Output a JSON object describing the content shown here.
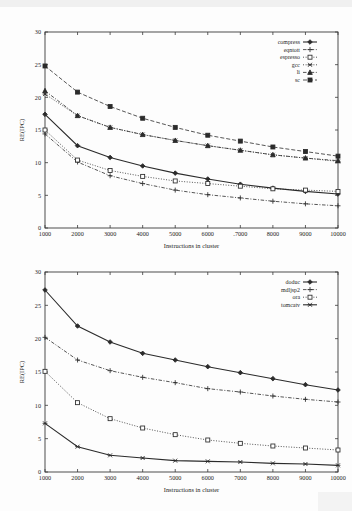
{
  "figures": [
    {
      "id": "top",
      "chart_data": {
        "type": "line",
        "title": "",
        "xlabel": "Instructions in cluster",
        "ylabel": "RE(IPC)",
        "xlim": [
          1000,
          10000
        ],
        "ylim": [
          0,
          30
        ],
        "xticks": [
          1000,
          2000,
          3000,
          4000,
          5000,
          6000,
          7000,
          8000,
          9000,
          10000
        ],
        "xticklabels": [
          "1000",
          "2000",
          "3000",
          "4000",
          "5000",
          "6000",
          ".7000",
          "8000",
          "9000",
          "10000"
        ],
        "yticks": [
          0,
          5,
          10,
          15,
          20,
          25,
          30
        ],
        "yticklabels": [
          "0",
          "5",
          "10",
          "15",
          "20",
          "25",
          "30"
        ],
        "grid": false,
        "legend_position": "top-right",
        "x": [
          1000,
          2000,
          3000,
          4000,
          5000,
          6000,
          7000,
          8000,
          9000,
          10000
        ],
        "series": [
          {
            "name": "compress",
            "marker": "filled-diamond",
            "dash": "solid",
            "values": [
              17.4,
              12.6,
              10.8,
              9.5,
              8.4,
              7.5,
              6.7,
              6.1,
              5.6,
              5.2
            ]
          },
          {
            "name": "eqntott",
            "marker": "plus",
            "dash": "dashdot",
            "values": [
              14.4,
              10.1,
              8.0,
              6.8,
              5.8,
              5.1,
              4.6,
              4.1,
              3.7,
              3.4
            ]
          },
          {
            "name": "espresso",
            "marker": "open-square",
            "dash": "dotted",
            "values": [
              15.0,
              10.4,
              8.8,
              7.9,
              7.2,
              6.8,
              6.4,
              6.0,
              5.8,
              5.6
            ]
          },
          {
            "name": "gcc",
            "marker": "cross",
            "dash": "dotted",
            "values": [
              20.5,
              17.2,
              15.4,
              14.3,
              13.4,
              12.6,
              11.9,
              11.2,
              10.7,
              10.2
            ]
          },
          {
            "name": "li",
            "marker": "filled-triangle",
            "dash": "dashdot",
            "values": [
              21.0,
              17.2,
              15.4,
              14.3,
              13.4,
              12.6,
              11.9,
              11.2,
              10.7,
              10.3
            ]
          },
          {
            "name": "sc",
            "marker": "filled-square",
            "dash": "dashed",
            "values": [
              24.8,
              20.8,
              18.6,
              16.8,
              15.4,
              14.2,
              13.3,
              12.4,
              11.7,
              11.0
            ]
          }
        ]
      }
    },
    {
      "id": "bottom",
      "chart_data": {
        "type": "line",
        "title": "",
        "xlabel": "Instructions in cluster",
        "ylabel": "RE(IPC)",
        "xlim": [
          1000,
          10000
        ],
        "ylim": [
          0,
          30
        ],
        "xticks": [
          1000,
          2000,
          3000,
          4000,
          5000,
          6000,
          7000,
          8000,
          9000,
          10000
        ],
        "xticklabels": [
          "1000",
          "2000",
          "3000",
          "4000",
          "5000",
          "6000",
          "7000",
          "8000",
          "9000",
          "10000"
        ],
        "yticks": [
          0,
          5,
          10,
          15,
          20,
          25,
          30
        ],
        "yticklabels": [
          "0",
          "5",
          "10",
          "15",
          "20",
          "25",
          "30"
        ],
        "grid": false,
        "legend_position": "top-right",
        "x": [
          1000,
          2000,
          3000,
          4000,
          5000,
          6000,
          7000,
          8000,
          9000,
          10000
        ],
        "series": [
          {
            "name": "doduc",
            "marker": "filled-diamond",
            "dash": "solid",
            "values": [
              27.3,
              21.9,
              19.5,
              17.8,
              16.8,
              15.8,
              14.9,
              14.0,
              13.1,
              12.3
            ]
          },
          {
            "name": "mdljsp2",
            "marker": "plus",
            "dash": "dashdot",
            "values": [
              20.2,
              16.8,
              15.2,
              14.2,
              13.4,
              12.5,
              12.0,
              11.4,
              10.9,
              10.5
            ]
          },
          {
            "name": "ora",
            "marker": "open-square",
            "dash": "dotted",
            "values": [
              15.1,
              10.4,
              8.0,
              6.6,
              5.6,
              4.8,
              4.3,
              3.9,
              3.6,
              3.3
            ]
          },
          {
            "name": "tomcatv",
            "marker": "cross",
            "dash": "solid",
            "values": [
              7.3,
              3.8,
              2.5,
              2.1,
              1.7,
              1.6,
              1.5,
              1.3,
              1.2,
              1.0
            ]
          }
        ]
      }
    }
  ]
}
